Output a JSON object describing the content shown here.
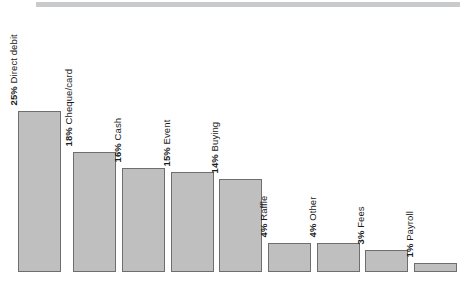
{
  "chart": {
    "type": "bar",
    "title": "",
    "background_color": "#ffffff",
    "bar_fill_color": "#bfbfbf",
    "bar_border_color": "#6e6e6e",
    "top_band_color": "#c9cacb"
  },
  "chart_data": {
    "type": "bar",
    "title": "",
    "subtitle": "",
    "xlabel": "",
    "ylabel": "",
    "ylim": [
      0,
      25
    ],
    "grid": false,
    "legend": false,
    "orientation": "vertical",
    "value_unit": "%",
    "categories": [
      "Direct debit",
      "Cheque/card",
      "Cash",
      "Event",
      "Buying",
      "Raffle",
      "Other",
      "Fees",
      "Payroll"
    ],
    "values": [
      25,
      18,
      16,
      15,
      14,
      4,
      4,
      3,
      1
    ],
    "data_labels": [
      "25% Direct debit",
      "18% Cheque/card",
      "16% Cash",
      "15% Event",
      "14% Buying",
      "4% Raffle",
      "4% Other",
      "3% Fees",
      "1% Payroll"
    ],
    "point_labels": [
      {
        "percent": "25%",
        "name": "Direct debit"
      },
      {
        "percent": "18%",
        "name": "Cheque/card"
      },
      {
        "percent": "16%",
        "name": "Cash"
      },
      {
        "percent": "15%",
        "name": "Event"
      },
      {
        "percent": "14%",
        "name": "Buying"
      },
      {
        "percent": "4%",
        "name": "Raffle"
      },
      {
        "percent": "4%",
        "name": "Other"
      },
      {
        "percent": "3%",
        "name": "Fees"
      },
      {
        "percent": "1%",
        "name": "Payroll"
      }
    ]
  },
  "bars": [
    {
      "percent": "25%",
      "name": "Direct debit",
      "x": 18,
      "width": 43,
      "height": 161
    },
    {
      "percent": "18%",
      "name": "Cheque/card",
      "x": 73,
      "width": 43,
      "height": 120
    },
    {
      "percent": "16%",
      "name": "Cash",
      "x": 122,
      "width": 43,
      "height": 104
    },
    {
      "percent": "15%",
      "name": "Event",
      "x": 171,
      "width": 43,
      "height": 100
    },
    {
      "percent": "14%",
      "name": "Buying",
      "x": 219,
      "width": 43,
      "height": 93
    },
    {
      "percent": "4%",
      "name": "Raffle",
      "x": 268,
      "width": 43,
      "height": 29
    },
    {
      "percent": "4%",
      "name": "Other",
      "x": 317,
      "width": 43,
      "height": 29
    },
    {
      "percent": "3%",
      "name": "Fees",
      "x": 365,
      "width": 43,
      "height": 22
    },
    {
      "percent": "1%",
      "name": "Payroll",
      "x": 414,
      "width": 43,
      "height": 9
    }
  ]
}
